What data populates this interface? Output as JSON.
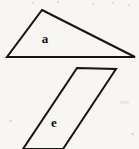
{
  "figure": {
    "background_color": "#f7f6f3",
    "stroke_color": "#16130f",
    "stroke_width": 2,
    "canvas": {
      "width": 139,
      "height": 149
    },
    "shapes": [
      {
        "id": "shape-a",
        "label": "a",
        "type": "triangle",
        "description": "obtuse scalene triangle",
        "points": "42,10 135,57 7,57",
        "label_position": {
          "x": 45,
          "y": 38
        }
      },
      {
        "id": "shape-e",
        "label": "e",
        "type": "parallelogram",
        "description": "parallelogram cropped at bottom edge of image",
        "points": "77,68 116,69 63,149 23,149",
        "label_position": {
          "x": 54,
          "y": 122
        }
      }
    ],
    "artifacts": [
      {
        "x": 32,
        "y": 2,
        "w": 2,
        "h": 2
      },
      {
        "x": 57,
        "y": 1,
        "w": 2,
        "h": 2
      },
      {
        "x": 92,
        "y": 3,
        "w": 2,
        "h": 2
      },
      {
        "x": 112,
        "y": 2,
        "w": 2,
        "h": 2
      },
      {
        "x": 128,
        "y": 4,
        "w": 2,
        "h": 2
      },
      {
        "x": 120,
        "y": 101,
        "w": 9,
        "h": 3
      },
      {
        "x": 9,
        "y": 120,
        "w": 3,
        "h": 2
      },
      {
        "x": 131,
        "y": 133,
        "w": 3,
        "h": 2
      }
    ]
  }
}
